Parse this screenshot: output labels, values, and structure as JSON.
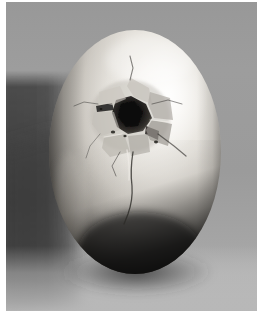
{
  "image": {
    "kind": "photograph",
    "subject": "cracked-egg",
    "description": "Black and white photograph of a single egg standing upright with a broken hole in its upper shell",
    "color_mode": "grayscale",
    "width": 266,
    "height": 313
  },
  "frame": {
    "border_color": "#ffffff",
    "left_border_width": 6,
    "right_border_width": 9,
    "top_border_width": 2,
    "bottom_border_width": 2
  },
  "palette": {
    "frame_white": "#ffffff",
    "background_upper_gray": "#9a9a9a",
    "background_right_gray": "#9e9e9e",
    "shadow_band_dark": "#3a3a3a",
    "shadow_band_darkest": "#2a2a2a",
    "foreground_surface": "#b4b4b4",
    "egg_highlight": "#f6f4f0",
    "egg_midtone": "#d6d2cb",
    "egg_shadow": "#6e6b66",
    "egg_deep_shadow": "#1d1c1a",
    "crack_hole_black": "#121110",
    "crack_line_dark": "#2e2c29",
    "shell_fragment_light": "#cfcbc4",
    "shell_fragment_mid": "#8e8a84"
  },
  "egg": {
    "center_x": 135,
    "center_y": 152,
    "radius_x": 86,
    "radius_y": 122,
    "top_y": 30,
    "bottom_y": 274,
    "left_x": 49,
    "right_x": 221,
    "highlight_x": 168,
    "highlight_y": 96,
    "shape": "ovoid-upright"
  },
  "crack": {
    "hole_center_x": 130,
    "hole_center_y": 113,
    "hole_width": 46,
    "hole_height": 40,
    "label": "broken shell opening",
    "fragment_count": 7,
    "has_radiating_lines": true,
    "vertical_fissure_start_y": 150,
    "vertical_fissure_end_y": 222
  },
  "background": {
    "shadow_band_left_x": 8,
    "shadow_band_right_x": 70,
    "shadow_band_top_y": 86,
    "shadow_band_bottom_y": 283,
    "foreground_top_y": 258
  },
  "accessibility": {
    "alt_text": "Grayscale photograph of a cracked egg with a jagged hole broken open near the top"
  }
}
